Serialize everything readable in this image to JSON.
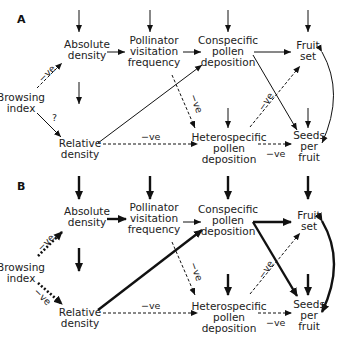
{
  "panels": [
    {
      "label": "A",
      "nodes": {
        "absolute_density": "Absolute\ndensity",
        "pollinator_visitation": "Pollinator\nvisitation\nfrequency",
        "conspecific_pollen": "Conspecific\npollen\ndeposition",
        "fruit_set": "Fruit\nset",
        "browsing_index": "Browsing\nindex",
        "relative_density": "Relative\ndensity",
        "heterospecific_pollen": "Heterospecific\npollen\ndeposition",
        "seeds_per_fruit": "Seeds\nper\nfruit"
      },
      "edge_labels": {
        "browse_abs": "−ve",
        "browse_rel": "?",
        "rel_het": "−ve",
        "poll_het": "−ve",
        "het_fruit": "−ve",
        "het_seeds": "−ve"
      }
    },
    {
      "label": "B",
      "nodes": {
        "absolute_density": "Absolute\ndensity",
        "pollinator_visitation": "Pollinator\nvisitation\nfrequency",
        "conspecific_pollen": "Conspecific\npollen\ndeposition",
        "fruit_set": "Fruit\nset",
        "browsing_index": "Browsing\nindex",
        "relative_density": "Relative\ndensity",
        "heterospecific_pollen": "Heterospecific\npollen\ndeposition",
        "seeds_per_fruit": "Seeds\nper\nfruit"
      },
      "edge_labels": {
        "browse_abs": "−ve",
        "browse_rel": "−ve",
        "rel_het": "−ve",
        "poll_het": "−ve",
        "het_fruit": "−ve",
        "het_seeds": "−ve"
      }
    }
  ]
}
